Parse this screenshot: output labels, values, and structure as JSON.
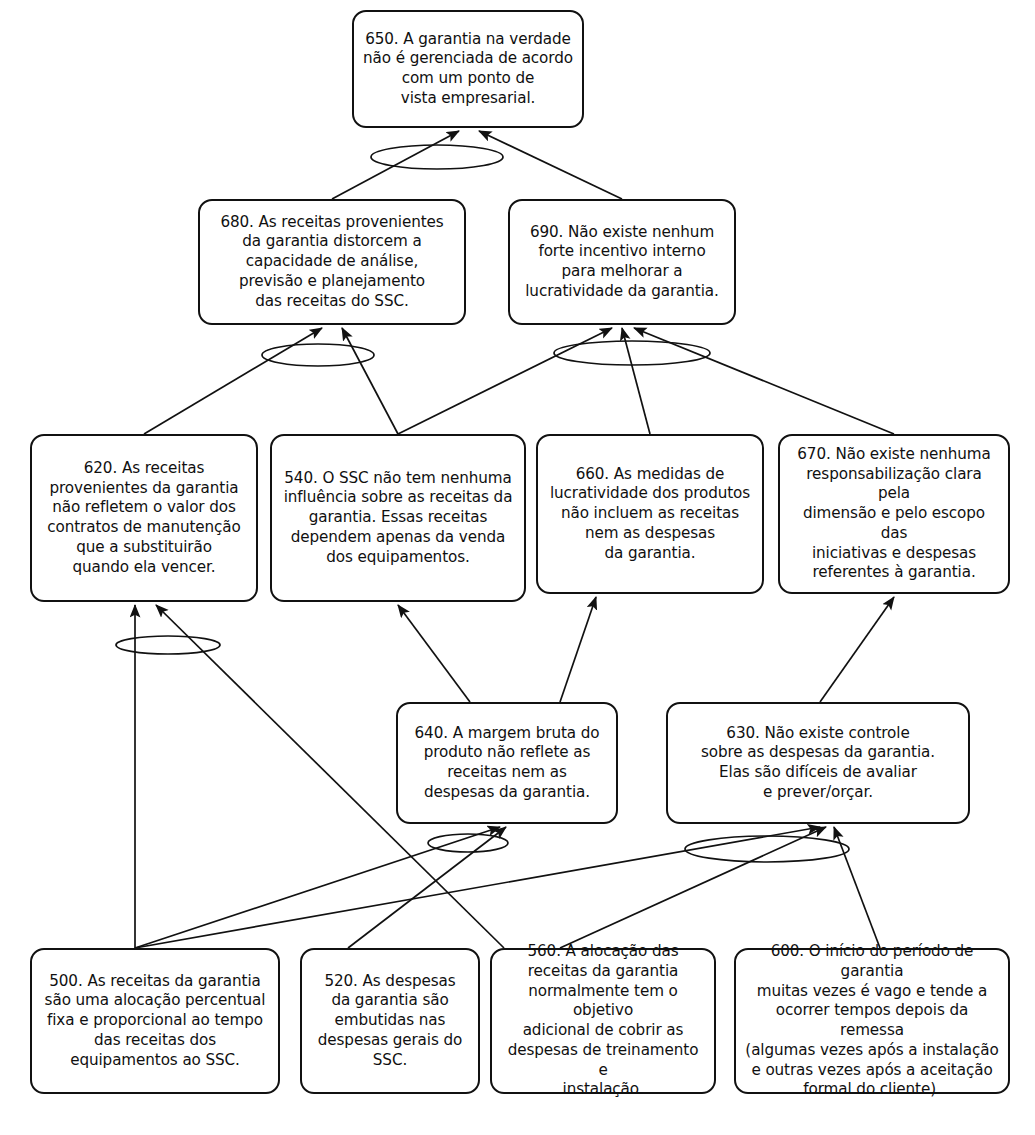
{
  "diagram": {
    "type": "current-reality-tree",
    "language": "pt-BR",
    "colors": {
      "box_border": "#111111",
      "box_fill": "#ffffff",
      "edge": "#111111",
      "background": "#ffffff"
    },
    "connector_symbol": "ellipse-and-connector"
  },
  "nodes": [
    {
      "id": "650",
      "label": "650. A garantia na verdade\nnão é gerenciada de acordo\ncom um ponto de\nvista empresarial.",
      "x": 352,
      "y": 10,
      "w": 232,
      "h": 118
    },
    {
      "id": "680",
      "label": "680. As receitas provenientes\nda garantia distorcem a\ncapacidade de análise,\nprevisão e planejamento\ndas receitas do SSC.",
      "x": 198,
      "y": 199,
      "w": 268,
      "h": 126
    },
    {
      "id": "690",
      "label": "690. Não existe nenhum\nforte incentivo interno\npara melhorar a\nlucratividade da garantia.",
      "x": 508,
      "y": 199,
      "w": 228,
      "h": 126
    },
    {
      "id": "620",
      "label": "620. As receitas\nprovenientes da garantia\nnão refletem o valor dos\ncontratos de manutenção\nque a substituirão\nquando ela vencer.",
      "x": 30,
      "y": 434,
      "w": 228,
      "h": 168
    },
    {
      "id": "540",
      "label": "540. O SSC não tem nenhuma\ninfluência sobre as receitas da\ngarantia. Essas receitas\ndependem apenas da venda\ndos equipamentos.",
      "x": 270,
      "y": 434,
      "w": 256,
      "h": 168
    },
    {
      "id": "660",
      "label": "660. As medidas de\nlucratividade dos produtos\nnão incluem as receitas\nnem as despesas\nda garantia.",
      "x": 536,
      "y": 434,
      "w": 228,
      "h": 160
    },
    {
      "id": "670",
      "label": "670. Não existe nenhuma\nresponsabilização clara pela\ndimensão e pelo escopo das\niniciativas e despesas\nreferentes à garantia.",
      "x": 778,
      "y": 434,
      "w": 232,
      "h": 160
    },
    {
      "id": "640",
      "label": "640. A margem bruta do\nproduto não reflete as\nreceitas nem as\ndespesas da garantia.",
      "x": 396,
      "y": 702,
      "w": 222,
      "h": 122
    },
    {
      "id": "630",
      "label": "630. Não existe controle\nsobre as despesas da garantia.\nElas são difíceis de avaliar\ne prever/orçar.",
      "x": 666,
      "y": 702,
      "w": 304,
      "h": 122
    },
    {
      "id": "500",
      "label": "500. As receitas da garantia\nsão uma alocação percentual\nfixa e proporcional ao tempo\ndas receitas dos\nequipamentos ao SSC.",
      "x": 30,
      "y": 948,
      "w": 250,
      "h": 146
    },
    {
      "id": "520",
      "label": "520. As despesas\nda garantia são\nembutidas nas\ndespesas gerais do\nSSC.",
      "x": 300,
      "y": 948,
      "w": 180,
      "h": 146
    },
    {
      "id": "560",
      "label": "560. A alocação das\nreceitas da garantia\nnormalmente tem o objetivo\nadicional de cobrir as\ndespesas de treinamento e\ninstalação.",
      "x": 490,
      "y": 948,
      "w": 226,
      "h": 146
    },
    {
      "id": "600",
      "label": "600. O início do período de garantia\nmuitas vezes é vago e tende a\nocorrer tempos depois da remessa\n(algumas vezes após a instalação\ne outras vezes após a aceitação\nformal do cliente).",
      "x": 734,
      "y": 948,
      "w": 276,
      "h": 146
    }
  ],
  "edges": [
    {
      "from": "680",
      "to": "650",
      "x1": 332,
      "y1": 199,
      "x2": 459,
      "y2": 131
    },
    {
      "from": "690",
      "to": "650",
      "x1": 622,
      "y1": 199,
      "x2": 479,
      "y2": 131
    },
    {
      "from": "620",
      "to": "680",
      "x1": 144,
      "y1": 434,
      "x2": 322,
      "y2": 328
    },
    {
      "from": "540",
      "to": "680",
      "x1": 398,
      "y1": 434,
      "x2": 342,
      "y2": 328
    },
    {
      "from": "540",
      "to": "690",
      "x1": 398,
      "y1": 434,
      "x2": 612,
      "y2": 328
    },
    {
      "from": "660",
      "to": "690",
      "x1": 650,
      "y1": 434,
      "x2": 622,
      "y2": 328
    },
    {
      "from": "670",
      "to": "690",
      "x1": 894,
      "y1": 434,
      "x2": 634,
      "y2": 328
    },
    {
      "from": "500",
      "to": "620",
      "x1": 135,
      "y1": 948,
      "x2": 135,
      "y2": 605
    },
    {
      "from": "560",
      "to": "620",
      "x1": 504,
      "y1": 948,
      "x2": 156,
      "y2": 605
    },
    {
      "from": "640",
      "to": "540",
      "x1": 470,
      "y1": 702,
      "x2": 398,
      "y2": 605
    },
    {
      "from": "640",
      "to": "660",
      "x1": 560,
      "y1": 702,
      "x2": 596,
      "y2": 597
    },
    {
      "from": "630",
      "to": "670",
      "x1": 820,
      "y1": 702,
      "x2": 894,
      "y2": 597
    },
    {
      "from": "500",
      "to": "640",
      "x1": 135,
      "y1": 948,
      "x2": 500,
      "y2": 827
    },
    {
      "from": "520",
      "to": "640",
      "x1": 348,
      "y1": 948,
      "x2": 506,
      "y2": 827
    },
    {
      "from": "500",
      "to": "630",
      "x1": 135,
      "y1": 948,
      "x2": 820,
      "y2": 827
    },
    {
      "from": "560",
      "to": "630",
      "x1": 560,
      "y1": 948,
      "x2": 826,
      "y2": 827
    },
    {
      "from": "600",
      "to": "630",
      "x1": 880,
      "y1": 948,
      "x2": 834,
      "y2": 827
    }
  ],
  "connectors": [
    {
      "id": "and-650",
      "cx": 437,
      "cy": 157,
      "rx": 66,
      "ry": 12,
      "for": "650"
    },
    {
      "id": "and-680",
      "cx": 318,
      "cy": 355,
      "rx": 56,
      "ry": 11,
      "for": "680"
    },
    {
      "id": "and-690",
      "cx": 632,
      "cy": 353,
      "rx": 78,
      "ry": 12,
      "for": "690"
    },
    {
      "id": "and-620",
      "cx": 168,
      "cy": 645,
      "rx": 52,
      "ry": 9,
      "for": "620"
    },
    {
      "id": "and-640",
      "cx": 468,
      "cy": 843,
      "rx": 40,
      "ry": 9,
      "for": "640"
    },
    {
      "id": "and-630",
      "cx": 767,
      "cy": 849,
      "rx": 82,
      "ry": 13,
      "for": "630"
    }
  ]
}
